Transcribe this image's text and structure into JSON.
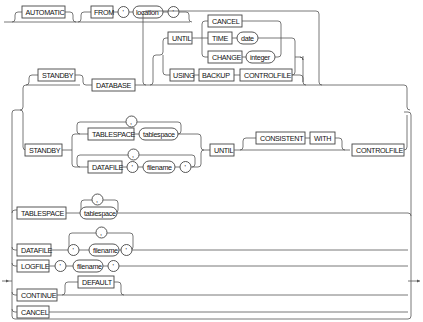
{
  "diagram": {
    "type": "railroad-syntax",
    "row1": {
      "automatic": "AUTOMATIC",
      "from": "FROM",
      "quote_open": "'",
      "location": "location",
      "quote_close": "'"
    },
    "database_branch": {
      "standby": "STANDBY",
      "database": "DATABASE",
      "until": "UNTIL",
      "cancel": "CANCEL",
      "time": "TIME",
      "date": "date",
      "change": "CHANGE",
      "integer": "integer",
      "using": "USING",
      "backup": "BACKUP",
      "controlfile": "CONTROLFILE"
    },
    "standby_branch": {
      "standby": "STANDBY",
      "tablespace": "TABLESPACE",
      "tablespace_var": "tablespace",
      "tablespace_sep": ",",
      "datafile": "DATAFILE",
      "datafile_sep": ",",
      "quote_open": "'",
      "filename": "filename",
      "quote_close": "'",
      "until": "UNTIL",
      "consistent": "CONSISTENT",
      "with": "WITH",
      "controlfile": "CONTROLFILE"
    },
    "options": {
      "tablespace": "TABLESPACE",
      "tablespace_sep": ",",
      "tablespace_var": "tablespace",
      "datafile": "DATAFILE",
      "datafile_sep": ",",
      "datafile_quote_open": "'",
      "datafile_filename": "filename",
      "datafile_quote_close": "'",
      "logfile": "LOGFILE",
      "logfile_quote_open": "'",
      "logfile_filename": "filename",
      "logfile_quote_close": "'",
      "continue": "CONTINUE",
      "default": "DEFAULT",
      "cancel": "CANCEL"
    }
  }
}
